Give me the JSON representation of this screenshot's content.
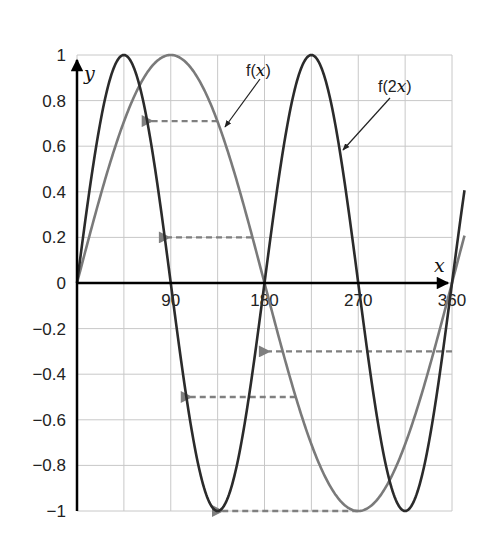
{
  "chart_data": {
    "type": "line",
    "title": "",
    "xlabel": "x",
    "ylabel": "y",
    "xlim": [
      0,
      375
    ],
    "ylim": [
      -1,
      1
    ],
    "grid": true,
    "x_grid_step": 45,
    "y_grid_step": 0.2,
    "x_ticks": [
      90,
      180,
      270,
      360
    ],
    "x_tick_labels": [
      "90",
      "180",
      "270",
      "360"
    ],
    "y_ticks": [
      1,
      0.8,
      0.6,
      0.4,
      0.2,
      0,
      -0.2,
      -0.4,
      -0.6,
      -0.8,
      -1
    ],
    "y_tick_labels": [
      "1",
      "0.8",
      "0.6",
      "0.4",
      "0.2",
      "0",
      "−0.2",
      "−0.4",
      "−0.6",
      "−0.8",
      "−1"
    ],
    "series": [
      {
        "name": "f(x)",
        "function": "sin(x)",
        "color": "#7a7a7a",
        "x": [
          0,
          45,
          90,
          135,
          180,
          225,
          270,
          315,
          360,
          372
        ],
        "y": [
          0,
          0.71,
          1,
          0.71,
          0,
          -0.71,
          -1,
          -0.71,
          0,
          0.21
        ]
      },
      {
        "name": "f(2x)",
        "function": "sin(2x)",
        "color": "#2b2b2b",
        "x": [
          0,
          22.5,
          45,
          67.5,
          90,
          112.5,
          135,
          157.5,
          180,
          202.5,
          225,
          247.5,
          270,
          292.5,
          315,
          337.5,
          360,
          372
        ],
        "y": [
          0,
          0.71,
          1,
          0.71,
          0,
          -0.71,
          -1,
          -0.71,
          0,
          0.71,
          1,
          0.71,
          0,
          -0.71,
          -1,
          -0.71,
          0,
          0.41
        ]
      }
    ],
    "annotations": [
      {
        "type": "dashed-arrow",
        "from": [
          135,
          0.71
        ],
        "to": [
          67.5,
          0.71
        ],
        "note": "f(x) point mapped to f(2x) at half x"
      },
      {
        "type": "dashed-arrow",
        "from": [
          168,
          0.2
        ],
        "to": [
          84,
          0.2
        ]
      },
      {
        "type": "dashed-arrow",
        "from": [
          360,
          -0.3
        ],
        "to": [
          180,
          -0.3
        ]
      },
      {
        "type": "dashed-arrow",
        "from": [
          210,
          -0.5
        ],
        "to": [
          105,
          -0.5
        ]
      },
      {
        "type": "dashed-arrow",
        "from": [
          270,
          -1
        ],
        "to": [
          135,
          -1
        ]
      },
      {
        "type": "label-arrow",
        "text": "f(x)",
        "points_to": [
          135,
          0.71
        ]
      },
      {
        "type": "label-arrow",
        "text": "f(2x)",
        "points_to": [
          243,
          0.6
        ]
      }
    ],
    "legend": "none (curves labeled directly with leader arrows)"
  },
  "labels": {
    "fx": "f(",
    "fx_var": "x",
    "fx_close": ")",
    "f2x": "f(2",
    "f2x_var": "x",
    "f2x_close": ")",
    "x_axis": "x",
    "y_axis": "y"
  },
  "colors": {
    "fx": "#7a7a7a",
    "f2x": "#2b2b2b",
    "grid": "#c8c8c8",
    "arrow": "#7f7f7f"
  }
}
